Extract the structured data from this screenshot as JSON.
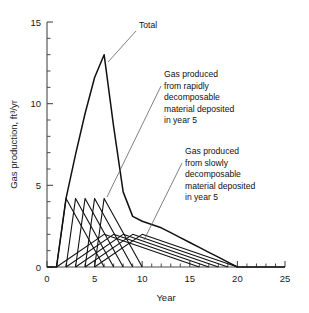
{
  "chart_data": {
    "type": "line",
    "title": "",
    "xlabel": "Year",
    "ylabel": "Gas production, ft³/yr",
    "xlim": [
      0,
      25
    ],
    "ylim": [
      0,
      15
    ],
    "xticks": [
      0,
      5,
      10,
      15,
      20,
      25
    ],
    "xticklabels": [
      "0",
      "5",
      "10",
      "15",
      "20",
      "25"
    ],
    "yticks": [
      0,
      5,
      10,
      15
    ],
    "yticklabels": [
      "0",
      "5",
      "10",
      "15"
    ],
    "x_minor_tick_step": 1,
    "y_minor_tick_step": 1,
    "grid": false,
    "legend": false,
    "series": [
      {
        "name": "Total",
        "kind": "total",
        "x": [
          0,
          1,
          2,
          3,
          4,
          5,
          6,
          7,
          8,
          9,
          10,
          11,
          12,
          13,
          14,
          15,
          16,
          17,
          18,
          19,
          20,
          25
        ],
        "y": [
          0,
          0,
          4.2,
          6.9,
          9.4,
          11.6,
          13.0,
          8.6,
          4.6,
          3.1,
          2.8,
          2.6,
          2.4,
          2.1,
          1.8,
          1.5,
          1.2,
          0.9,
          0.6,
          0.3,
          0.0,
          0.0
        ]
      },
      {
        "name": "Gas produced from rapidly decomposable material deposited in year 1",
        "kind": "rapid",
        "x": [
          1,
          2,
          6
        ],
        "y": [
          0,
          4.2,
          0
        ]
      },
      {
        "name": "Gas produced from rapidly decomposable material deposited in year 2",
        "kind": "rapid",
        "x": [
          2,
          3,
          7
        ],
        "y": [
          0,
          4.2,
          0
        ]
      },
      {
        "name": "Gas produced from rapidly decomposable material deposited in year 3",
        "kind": "rapid",
        "x": [
          3,
          4,
          8
        ],
        "y": [
          0,
          4.2,
          0
        ]
      },
      {
        "name": "Gas produced from rapidly decomposable material deposited in year 4",
        "kind": "rapid",
        "x": [
          4,
          5,
          9
        ],
        "y": [
          0,
          4.2,
          0
        ]
      },
      {
        "name": "Gas produced from rapidly decomposable material deposited in year 5",
        "kind": "rapid",
        "x": [
          5,
          6,
          10
        ],
        "y": [
          0,
          4.2,
          0
        ]
      },
      {
        "name": "Gas produced from slowly decomposable material deposited in year 1",
        "kind": "slow",
        "x": [
          1,
          6,
          16
        ],
        "y": [
          0,
          2.0,
          0
        ]
      },
      {
        "name": "Gas produced from slowly decomposable material deposited in year 2",
        "kind": "slow",
        "x": [
          2,
          7,
          17
        ],
        "y": [
          0,
          2.0,
          0
        ]
      },
      {
        "name": "Gas produced from slowly decomposable material deposited in year 3",
        "kind": "slow",
        "x": [
          3,
          8,
          18
        ],
        "y": [
          0,
          2.0,
          0
        ]
      },
      {
        "name": "Gas produced from slowly decomposable material deposited in year 4",
        "kind": "slow",
        "x": [
          4,
          9,
          19
        ],
        "y": [
          0,
          2.0,
          0
        ]
      },
      {
        "name": "Gas produced from slowly decomposable material deposited in year 5",
        "kind": "slow",
        "x": [
          5,
          10,
          20
        ],
        "y": [
          0,
          2.0,
          0
        ]
      }
    ],
    "annotations": [
      {
        "id": "total",
        "lines": [
          "Total"
        ],
        "text_x": 139,
        "text_y": 28,
        "leader": [
          [
            136,
            31
          ],
          [
            108,
            62
          ]
        ]
      },
      {
        "id": "rapid",
        "lines": [
          "Gas produced",
          "from rapidly",
          "decomposable",
          "material deposited",
          "in year 5"
        ],
        "text_x": 164,
        "text_y": 77,
        "leader": [
          [
            161,
            86
          ],
          [
            107,
            197
          ]
        ]
      },
      {
        "id": "slow",
        "lines": [
          "Gas produced",
          "from slowly",
          "decomposable",
          "material deposited",
          "in year 5"
        ],
        "text_x": 185,
        "text_y": 154,
        "leader": [
          [
            182,
            163
          ],
          [
            144,
            240
          ]
        ]
      }
    ]
  }
}
